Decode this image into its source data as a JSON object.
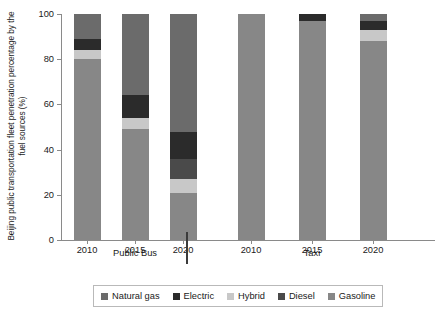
{
  "chart_data": {
    "type": "bar",
    "subtype": "stacked-bar-100-percent",
    "title": "",
    "xlabel": "",
    "ylabel": "Beijing public transportation fleet penetration percentage by the fuel sources (%)",
    "ylim": [
      0,
      100
    ],
    "yticks": [
      0,
      20,
      40,
      60,
      80,
      100
    ],
    "ytick_labels": [
      "0",
      "20",
      "40",
      "60",
      "80",
      "100"
    ],
    "grid": false,
    "legend_position": "bottom",
    "groups": [
      "Public Bus",
      "Taxi"
    ],
    "categories": [
      "2010",
      "2015",
      "2020",
      "2010",
      "2015",
      "2020"
    ],
    "x": [
      {
        "year": "2010",
        "group": "Public Bus"
      },
      {
        "year": "2015",
        "group": "Public Bus"
      },
      {
        "year": "2020",
        "group": "Public Bus"
      },
      {
        "year": "2010",
        "group": "Taxi"
      },
      {
        "year": "2015",
        "group": "Taxi"
      },
      {
        "year": "2020",
        "group": "Taxi"
      }
    ],
    "series": [
      {
        "name": "Natural gas",
        "color": "#6b6b6b",
        "values": [
          11,
          36,
          52,
          0,
          0,
          3
        ]
      },
      {
        "name": "Electric",
        "color": "#2b2b2b",
        "values": [
          5,
          10,
          12,
          0,
          3,
          4
        ]
      },
      {
        "name": "Hybrid",
        "color": "#c8c8c8",
        "values": [
          4,
          5,
          6,
          0,
          0,
          5
        ]
      },
      {
        "name": "Diesel",
        "color": "#4a4a4a",
        "values": [
          0,
          0,
          9,
          0,
          0,
          0
        ]
      },
      {
        "name": "Gasoline",
        "color": "#878787",
        "values": [
          80,
          49,
          21,
          100,
          97,
          88
        ]
      }
    ],
    "stack_order_bottom_to_top": [
      "Gasoline",
      "Diesel",
      "Hybrid",
      "Electric",
      "Natural gas"
    ],
    "bars": [
      {
        "label": "2010",
        "group": "Public Bus",
        "segments": [
          {
            "name": "Gasoline",
            "value": 80
          },
          {
            "name": "Hybrid",
            "value": 4
          },
          {
            "name": "Electric",
            "value": 5
          },
          {
            "name": "Natural gas",
            "value": 11
          }
        ]
      },
      {
        "label": "2015",
        "group": "Public Bus",
        "segments": [
          {
            "name": "Gasoline",
            "value": 49
          },
          {
            "name": "Hybrid",
            "value": 5
          },
          {
            "name": "Electric",
            "value": 10
          },
          {
            "name": "Natural gas",
            "value": 36
          }
        ]
      },
      {
        "label": "2020",
        "group": "Public Bus",
        "segments": [
          {
            "name": "Gasoline",
            "value": 21
          },
          {
            "name": "Hybrid",
            "value": 6
          },
          {
            "name": "Diesel",
            "value": 9
          },
          {
            "name": "Electric",
            "value": 12
          },
          {
            "name": "Natural gas",
            "value": 52
          }
        ]
      },
      {
        "label": "2010",
        "group": "Taxi",
        "segments": [
          {
            "name": "Gasoline",
            "value": 100
          }
        ]
      },
      {
        "label": "2015",
        "group": "Taxi",
        "segments": [
          {
            "name": "Gasoline",
            "value": 97
          },
          {
            "name": "Electric",
            "value": 3
          }
        ]
      },
      {
        "label": "2020",
        "group": "Taxi",
        "segments": [
          {
            "name": "Gasoline",
            "value": 88
          },
          {
            "name": "Hybrid",
            "value": 5
          },
          {
            "name": "Electric",
            "value": 4
          },
          {
            "name": "Natural gas",
            "value": 3
          }
        ]
      }
    ]
  },
  "axis": {
    "y_title": "Beijing public transportation fleet penetration percentage by the fuel sources (%)",
    "y_tick_labels": [
      "100",
      "80",
      "60",
      "40",
      "20",
      "0"
    ],
    "x_tick_labels": [
      "2010",
      "2015",
      "2020",
      "2010",
      "2015",
      "2020"
    ],
    "group_labels": [
      "Public Bus",
      "Taxi"
    ]
  },
  "legend": {
    "entries": [
      {
        "label": "Natural gas",
        "color": "#6b6b6b"
      },
      {
        "label": "Electric",
        "color": "#2b2b2b"
      },
      {
        "label": "Hybrid",
        "color": "#c8c8c8"
      },
      {
        "label": "Diesel",
        "color": "#4a4a4a"
      },
      {
        "label": "Gasoline",
        "color": "#878787"
      }
    ]
  },
  "colors": {
    "natural_gas": "#6b6b6b",
    "electric": "#2b2b2b",
    "hybrid": "#c8c8c8",
    "diesel": "#4a4a4a",
    "gasoline": "#878787",
    "axis": "#8a8a8a",
    "text": "#1a1a1a",
    "background": "#ffffff"
  }
}
